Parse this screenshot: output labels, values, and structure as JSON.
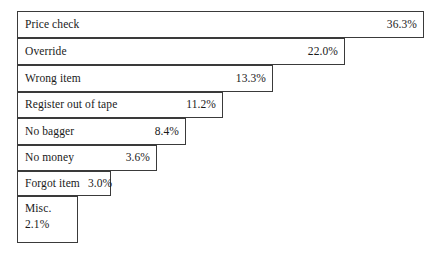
{
  "chart_data": {
    "type": "bar",
    "title": "",
    "subtitle": "",
    "xlabel": "",
    "ylabel": "",
    "orientation": "horizontal",
    "grid": false,
    "legend": false,
    "value_suffix": "%",
    "xlim": [
      0,
      36.3
    ],
    "categories": [
      "Price check",
      "Override",
      "Wrong item",
      "Register out of tape",
      "No bagger",
      "No money",
      "Forgot item",
      "Misc."
    ],
    "values": [
      36.3,
      22.0,
      13.3,
      11.2,
      8.4,
      3.6,
      3.0,
      2.1
    ],
    "value_labels": [
      "36.3%",
      "22.0%",
      "13.3%",
      "11.2%",
      "8.4%",
      "3.6%",
      "3.0%",
      "2.1%"
    ],
    "bars": [
      {
        "label": "Price check",
        "value": 36.3,
        "value_label": "36.3%"
      },
      {
        "label": "Override",
        "value": 22.0,
        "value_label": "22.0%"
      },
      {
        "label": "Wrong item",
        "value": 13.3,
        "value_label": "13.3%"
      },
      {
        "label": "Register out of tape",
        "value": 11.2,
        "value_label": "11.2%"
      },
      {
        "label": "No bagger",
        "value": 8.4,
        "value_label": "8.4%"
      },
      {
        "label": "No money",
        "value": 3.6,
        "value_label": "3.6%"
      },
      {
        "label": "Forgot item",
        "value": 3.0,
        "value_label": "3.0%"
      },
      {
        "label": "Misc.",
        "value": 2.1,
        "value_label": "2.1%"
      }
    ],
    "colors": {
      "bar_fill": "#ffffff",
      "bar_border": "#3a3a3a",
      "text": "#1a1a1a",
      "background": "#ffffff"
    }
  }
}
